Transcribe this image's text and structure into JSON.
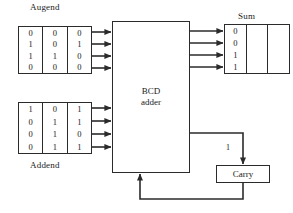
{
  "diagram": {
    "line_color": "#2b2b2b",
    "text_color": "#1a1a1a",
    "background": "#ffffff"
  },
  "augend": {
    "label": "Augend",
    "columns": 3,
    "rows": [
      [
        "0",
        "0",
        "0"
      ],
      [
        "1",
        "0",
        "1"
      ],
      [
        "1",
        "1",
        "0"
      ],
      [
        "0",
        "0",
        "0"
      ]
    ]
  },
  "addend": {
    "label": "Addend",
    "columns": 3,
    "rows": [
      [
        "1",
        "0",
        "1"
      ],
      [
        "0",
        "1",
        "1"
      ],
      [
        "0",
        "1",
        "0"
      ],
      [
        "0",
        "1",
        "1"
      ]
    ]
  },
  "adder": {
    "line1": "BCD",
    "line2": "adder"
  },
  "sum": {
    "label": "Sum",
    "columns": 3,
    "rows": [
      [
        "0",
        "",
        ""
      ],
      [
        "0",
        "",
        ""
      ],
      [
        "1",
        "",
        ""
      ],
      [
        "1",
        "",
        ""
      ]
    ]
  },
  "carry": {
    "label": "Carry",
    "signal_label": "1"
  }
}
